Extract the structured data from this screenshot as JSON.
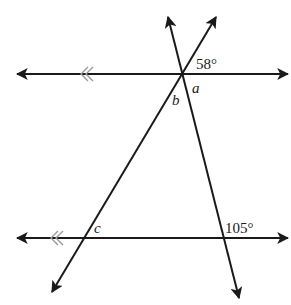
{
  "diagram": {
    "type": "geometry-parallel-lines-transversals",
    "colors": {
      "line": "#1a1a1a",
      "parallel_mark": "#9a9a9a",
      "background": "#ffffff"
    },
    "parallel_lines": [
      {
        "id": "top-line",
        "y": 74,
        "x1": 17,
        "x2": 288,
        "parallel_mark_x": 85
      },
      {
        "id": "bottom-line",
        "y": 238,
        "x1": 17,
        "x2": 288,
        "parallel_mark_x": 55
      }
    ],
    "transversals": [
      {
        "id": "transversal-right",
        "from": [
          168,
          17
        ],
        "to": [
          239,
          298
        ]
      },
      {
        "id": "transversal-left",
        "from": [
          216,
          17
        ],
        "to": [
          52,
          292
        ]
      }
    ],
    "labels": {
      "angle_58": "58°",
      "angle_a": "a",
      "angle_b": "b",
      "angle_c": "c",
      "angle_105": "105°"
    }
  }
}
